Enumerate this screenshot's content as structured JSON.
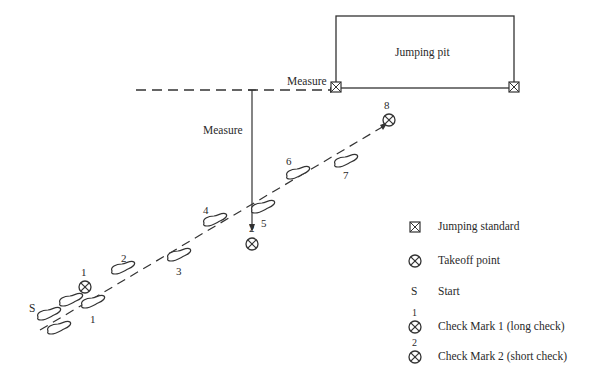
{
  "diagram": {
    "pit_label": "Jumping pit",
    "measure_horizontal_label": "Measure",
    "measure_vertical_label": "Measure",
    "start_label": "S",
    "takeoff_label": "8",
    "check_mark_1_label": "1",
    "check_mark_2_label": "2",
    "steps": [
      "1",
      "2",
      "3",
      "4",
      "5",
      "6",
      "7"
    ]
  },
  "legend": {
    "items": [
      {
        "icon": "jumping-standard-icon",
        "label": "Jumping standard"
      },
      {
        "icon": "takeoff-point-icon",
        "label": "Takeoff point"
      },
      {
        "icon": "S",
        "label": "Start"
      },
      {
        "icon": "check-mark-1-icon",
        "superscript": "1",
        "label": "Check Mark 1 (long check)"
      },
      {
        "icon": "check-mark-2-icon",
        "superscript": "2",
        "label": "Check Mark 2 (short check)"
      }
    ]
  },
  "colors": {
    "line": "#333333",
    "background": "#ffffff"
  }
}
